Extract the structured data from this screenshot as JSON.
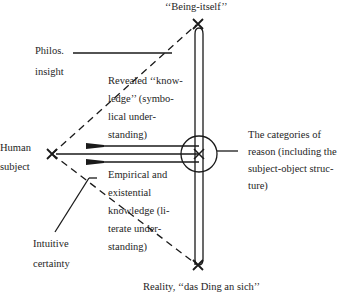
{
  "diagram": {
    "type": "conceptual-diagram",
    "nodes": {
      "being_itself": "‘‘Being-itself’’",
      "reality": "Reality, ‘‘das Ding an sich’’",
      "human_subject": "Human\nsubject",
      "categories_of_reason": "The categories of\nreason (including the\nsubject-object struc-\nture)"
    },
    "edge_labels": {
      "philos_insight": "Philos.\ninsight",
      "revealed_knowledge": "Revealed ‘‘know-\nledge’’ (symbo-\nlical under-\nstanding)",
      "empirical_knowledge": "Empirical and\nexistential\nknowledge (li-\nterate under-\nstanding)",
      "intuitive_certainty": "Intuitive\ncertainty"
    },
    "colors": {
      "line": "#1a1a1a",
      "background": "#ffffff"
    }
  }
}
